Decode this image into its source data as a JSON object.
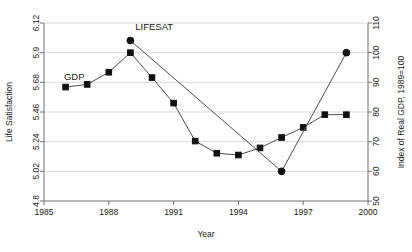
{
  "chart_data": {
    "type": "line",
    "title": "",
    "xlabel": "Year",
    "ylabel": "Life Satisfaction",
    "y2label": "Index of Real GDP, 1989=100",
    "xlim": [
      1985,
      2000
    ],
    "ylim": [
      4.8,
      6.12
    ],
    "y2lim": [
      50,
      110
    ],
    "grid": true,
    "legend": "inline-annotations",
    "xticks": [
      "1985",
      "1988",
      "1991",
      "1994",
      "1997",
      "2000"
    ],
    "xtick_values": [
      1985,
      1988,
      1991,
      1994,
      1997,
      2000
    ],
    "yticks": [
      "4.8",
      "5.02",
      "5.24",
      "5.46",
      "5.68",
      "5.9",
      "6.12"
    ],
    "ytick_values": [
      4.8,
      5.02,
      5.24,
      5.46,
      5.68,
      5.9,
      6.12
    ],
    "y2ticks": [
      "50",
      "60",
      "70",
      "80",
      "90",
      "100",
      "110"
    ],
    "y2tick_values": [
      50,
      60,
      70,
      80,
      90,
      100,
      110
    ],
    "series": [
      {
        "name": "GDP",
        "marker": "square",
        "axis": "right",
        "annotation": "GDP",
        "x": [
          1986,
          1987,
          1988,
          1989,
          1990,
          1991,
          1992,
          1993,
          1994,
          1995,
          1996,
          1997,
          1998,
          1999
        ],
        "values": [
          88.4,
          89.3,
          93.4,
          100.0,
          91.6,
          83.0,
          70.2,
          66.1,
          65.5,
          67.9,
          71.4,
          74.8,
          79.1,
          79.1
        ],
        "y_left_equivalent": [
          5.645,
          5.665,
          5.755,
          5.9,
          5.715,
          5.525,
          5.245,
          5.155,
          5.14,
          5.195,
          5.27,
          5.345,
          5.44,
          5.44
        ]
      },
      {
        "name": "LIFESAT",
        "marker": "circle",
        "axis": "left",
        "annotation": "LIFESAT",
        "x": [
          1989,
          1996,
          1999
        ],
        "values": [
          5.99,
          5.02,
          5.9
        ]
      }
    ],
    "annotations": [
      {
        "text": "GDP",
        "x": 1986.4,
        "y": 5.7
      },
      {
        "text": "LIFESAT",
        "x": 1990.1,
        "y": 6.07
      }
    ]
  }
}
